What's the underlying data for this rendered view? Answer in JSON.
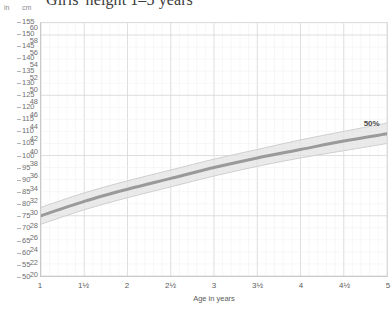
{
  "title": "Girls' height 1–5 years",
  "axes": {
    "unit_left": "in",
    "unit_right": "cm",
    "x_label": "Age in years"
  },
  "colors": {
    "curve": "#9a9a9a",
    "band": "#e3e3e3",
    "grid_major": "#d5d5d5",
    "grid_minor": "#eeeeee",
    "axis": "#c9c9c9",
    "text": "#5c5c5c"
  },
  "annotation": {
    "percentile_label": "50%"
  },
  "chart_data": {
    "type": "line",
    "title": "Girls' height 1–5 years",
    "xlabel": "Age in years",
    "ylabel": "cm",
    "ylabel_secondary": "in",
    "xlim": [
      1,
      5
    ],
    "ylim_cm": [
      50,
      155
    ],
    "ylim_in": [
      20,
      60
    ],
    "grid": true,
    "legend": "none",
    "x_ticks": [
      1,
      1.5,
      2,
      2.5,
      3,
      3.5,
      4,
      4.5,
      5
    ],
    "x_tick_labels": [
      "1",
      "1½",
      "2",
      "2½",
      "3",
      "3½",
      "4",
      "4½",
      "5"
    ],
    "y_ticks_cm": [
      50,
      55,
      60,
      65,
      70,
      75,
      80,
      85,
      90,
      95,
      100,
      105,
      110,
      115,
      120,
      125,
      130,
      135,
      140,
      145,
      150,
      155
    ],
    "y_ticks_in": [
      20,
      22,
      24,
      26,
      28,
      30,
      32,
      34,
      36,
      38,
      40,
      42,
      44,
      46,
      48,
      50,
      52,
      54,
      56,
      58,
      60
    ],
    "series": [
      {
        "name": "50%",
        "x": [
          1,
          1.5,
          2,
          2.5,
          3,
          3.5,
          4,
          4.5,
          5
        ],
        "values_cm": [
          75.0,
          81.0,
          86.0,
          90.5,
          95.0,
          99.0,
          102.5,
          106.0,
          109.0
        ],
        "band_upper_cm": [
          78.5,
          84.5,
          89.5,
          94.0,
          98.5,
          102.5,
          106.5,
          110.0,
          113.5
        ],
        "band_lower_cm": [
          71.5,
          77.5,
          82.5,
          87.0,
          91.5,
          95.5,
          99.0,
          102.0,
          105.0
        ]
      }
    ]
  }
}
